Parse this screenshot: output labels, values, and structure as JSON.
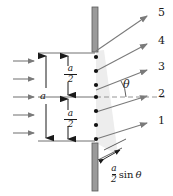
{
  "figure": {
    "colors": {
      "ink": "#1a1a1a",
      "ray": "#6e6e6e",
      "barrier_fill": "#9a9a9a",
      "barrier_edge": "#5a5a5a",
      "wedge_fill": "#ededed",
      "dot": "#111111",
      "dash": "#8a8a8a"
    },
    "incoming_wave_arrows": {
      "name": "incident-plane-wave-arrows",
      "count": 5,
      "y_positions": [
        61,
        79,
        97,
        115,
        133
      ],
      "x_start": 13,
      "x_end": 37
    },
    "slit": {
      "name": "single-slit",
      "x": 94,
      "top_barrier": {
        "y_top": 7,
        "y_bottom": 51
      },
      "bottom_barrier": {
        "y_top": 143,
        "y_bottom": 191
      },
      "aperture": {
        "y_top": 51,
        "y_bottom": 143
      },
      "width_label": "a"
    },
    "sources": {
      "name": "wavelet-source-points",
      "count": 7,
      "y_positions": [
        57,
        71,
        85,
        97,
        111,
        125,
        139
      ],
      "x": 96
    },
    "rays": [
      {
        "id": "ray-5",
        "label": "5",
        "label_x": 159,
        "label_y": 7,
        "y_origin": 51,
        "tip_x": 150,
        "tip_y": 14
      },
      {
        "id": "ray-4",
        "label": "4",
        "label_x": 159,
        "label_y": 36,
        "y_origin": 71,
        "tip_x": 150,
        "tip_y": 43
      },
      {
        "id": "ray-3",
        "label": "3",
        "label_x": 159,
        "label_y": 62,
        "y_origin": 90,
        "tip_x": 150,
        "tip_y": 69
      },
      {
        "id": "ray-2",
        "label": "2",
        "label_x": 159,
        "label_y": 88,
        "y_origin": 112,
        "tip_x": 150,
        "tip_y": 95
      },
      {
        "id": "ray-1",
        "label": "1",
        "label_x": 159,
        "label_y": 115,
        "y_origin": 139,
        "tip_x": 150,
        "tip_y": 122
      }
    ],
    "dimensions": {
      "full": {
        "name": "slit-width-a",
        "label": "a",
        "label_x": 41,
        "label_y": 92,
        "line_x": 46,
        "y_top": 54,
        "y_bottom": 140
      },
      "upper_half": {
        "name": "half-slit-upper",
        "numerator": "a",
        "denominator": "2",
        "label_x": 71,
        "label_y": 70,
        "line_x": 68,
        "y_top": 54,
        "y_bottom": 97
      },
      "lower_half": {
        "name": "half-slit-lower",
        "numerator": "a",
        "denominator": "2",
        "label_x": 71,
        "label_y": 115,
        "line_x": 68,
        "y_top": 97,
        "y_bottom": 140
      }
    },
    "angle": {
      "name": "diffraction-angle-theta",
      "symbol": "θ",
      "label_x": 124,
      "label_y": 80,
      "vertex_x": 96,
      "vertex_y": 97
    },
    "path_difference": {
      "name": "path-difference-label",
      "numerator": "a",
      "denominator": "2",
      "function": "sin",
      "symbol": "θ",
      "text": "a/2 sin θ",
      "x": 112,
      "y": 171
    },
    "axis_dashed_line": {
      "name": "optical-axis-dashed",
      "y": 97,
      "x_start": 96,
      "x_end": 168
    }
  }
}
